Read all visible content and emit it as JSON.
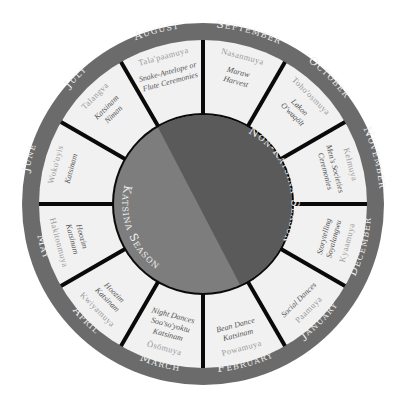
{
  "diagram": {
    "type": "circular-calendar",
    "colors": {
      "ring": "#6b6b6b",
      "segment_fill": "#f1f1f1",
      "divider": "#0a0a0a",
      "katsina_season": "#7d7d7d",
      "non_katsina_season": "#5a5a5a",
      "month_text": "#f2f2f2",
      "hopi_text": "#9a9a9a",
      "event_text": "#555555"
    },
    "center": {
      "seasons": [
        {
          "label": "Non-Katsina Season"
        },
        {
          "label": "Katsina Season"
        }
      ]
    },
    "months": [
      {
        "month": "September",
        "hopi": "Nasanmuya",
        "events": [
          "Maraw",
          "Harvest"
        ]
      },
      {
        "month": "October",
        "hopi": "Toho'osmuya",
        "events": [
          "Lakon",
          "O'waqölt"
        ]
      },
      {
        "month": "November",
        "hopi": "Kelmuya",
        "events": [
          "Men's Societies",
          "Ceremonies"
        ]
      },
      {
        "month": "December",
        "hopi": "Kyaamuya",
        "events": [
          "Storytelling",
          "Soyalangwu"
        ]
      },
      {
        "month": "January",
        "hopi": "Paamuya",
        "events": [
          "Social Dances"
        ]
      },
      {
        "month": "February",
        "hopi": "Powamuya",
        "events": [
          "Bean Dance",
          "Katsinam"
        ]
      },
      {
        "month": "March",
        "hopi": "Ösömuya",
        "events": [
          "Night Dances",
          "Soo'so'yoktu",
          "Katsinam"
        ]
      },
      {
        "month": "April",
        "hopi": "Kwiyamuya",
        "events": [
          "Hoozim",
          "Katsinam"
        ]
      },
      {
        "month": "May",
        "hopi": "Hakitonmuya",
        "events": [
          "Hoozim",
          "Katsinam"
        ]
      },
      {
        "month": "June",
        "hopi": "Woko'uyis",
        "events": [
          "Katsinam"
        ]
      },
      {
        "month": "July",
        "hopi": "Talangva",
        "events": [
          "Katsinam",
          "Niman"
        ]
      },
      {
        "month": "August",
        "hopi": "Tala'paamuya",
        "events": [
          "Snake-Antelope or",
          "Flute Ceremonies"
        ]
      }
    ]
  }
}
